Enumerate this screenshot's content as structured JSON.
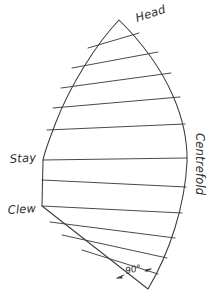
{
  "diagram": {
    "type": "line-drawing",
    "style": "hand-drawn pencil sketch",
    "background_color": "#ffffff",
    "ink_color": "#3b3b3b",
    "labels": {
      "head": "Head",
      "centrefold": "Centrefold",
      "stay": "Stay",
      "clew": "Clew",
      "angle": "90°"
    },
    "label_positions": {
      "head": {
        "x": 137,
        "y": 22,
        "rotation": -18
      },
      "centrefold": {
        "x": 196,
        "y": 133,
        "rotation": 90
      },
      "stay": {
        "x": 10,
        "y": 163,
        "rotation": -4
      },
      "clew": {
        "x": 8,
        "y": 214,
        "rotation": -4
      },
      "angle": {
        "x": 128,
        "y": 275,
        "rotation": -12
      }
    },
    "corners": {
      "head": {
        "x": 119,
        "y": 20
      },
      "stay": {
        "x": 43,
        "y": 160
      },
      "clew": {
        "x": 42,
        "y": 206
      },
      "tack": {
        "x": 148,
        "y": 289
      }
    },
    "outline_segments": [
      {
        "name": "luff-upper-curve",
        "from": "head",
        "to": "stay"
      },
      {
        "name": "luff-lower-straight",
        "from": "stay",
        "to": "clew"
      },
      {
        "name": "foot-straight",
        "from": "clew",
        "to": "tack"
      },
      {
        "name": "leech-curve",
        "from": "tack",
        "to": "head"
      }
    ],
    "panel_count": 12,
    "seam_count": 11,
    "seams": [
      {
        "index": 1,
        "left_x": 88,
        "left_y": 48,
        "right_x": 139,
        "right_y": 33
      },
      {
        "index": 2,
        "left_x": 72,
        "left_y": 68,
        "right_x": 158,
        "right_y": 52
      },
      {
        "index": 3,
        "left_x": 61,
        "left_y": 88,
        "right_x": 171,
        "right_y": 73
      },
      {
        "index": 4,
        "left_x": 53,
        "left_y": 108,
        "right_x": 180,
        "right_y": 97
      },
      {
        "index": 5,
        "left_x": 47,
        "left_y": 130,
        "right_x": 185,
        "right_y": 124
      },
      {
        "index": 6,
        "left_x": 43,
        "left_y": 160,
        "right_x": 187,
        "right_y": 158
      },
      {
        "index": 7,
        "left_x": 42,
        "left_y": 180,
        "right_x": 186,
        "right_y": 187
      },
      {
        "index": 8,
        "left_x": 42,
        "left_y": 206,
        "right_x": 182,
        "right_y": 213
      },
      {
        "index": 9,
        "left_x": 50,
        "left_y": 222,
        "right_x": 175,
        "right_y": 238
      },
      {
        "index": 10,
        "left_x": 62,
        "left_y": 235,
        "right_x": 167,
        "right_y": 258
      },
      {
        "index": 11,
        "left_x": 82,
        "left_y": 250,
        "right_x": 158,
        "right_y": 274
      }
    ],
    "annotation": {
      "name": "right-angle-marker",
      "text": "90°",
      "arrow_left_tip": {
        "x": 117,
        "y": 278
      },
      "arrow_right_tip": {
        "x": 151,
        "y": 269
      }
    }
  }
}
